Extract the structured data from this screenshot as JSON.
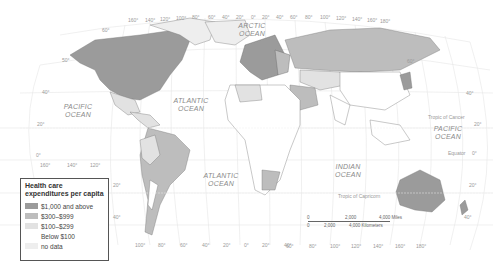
{
  "legend": {
    "title": "Health care expenditures per capita",
    "items": [
      {
        "label": "$1,000 and above",
        "color": "#9b9b9b"
      },
      {
        "label": "$300–$999",
        "color": "#bdbdbd"
      },
      {
        "label": "$100–$299",
        "color": "#e2e2e2"
      },
      {
        "label": "Below $100",
        "color": "#ffffff"
      },
      {
        "label": "no data",
        "color": "#eeeeee"
      }
    ]
  },
  "oceans": {
    "arctic": "ARCTIC OCEAN",
    "pacific_west": "PACIFIC OCEAN",
    "atlantic_north": "ATLANTIC OCEAN",
    "atlantic_south": "ATLANTIC OCEAN",
    "indian": "INDIAN OCEAN",
    "pacific_east": "PACIFIC OCEAN"
  },
  "lines": {
    "tropic_cancer": "Tropic of Cancer",
    "tropic_capricorn": "Tropic of Capricorn",
    "equator": "Equator"
  },
  "scale": {
    "miles": [
      "0",
      "2,000",
      "4,000 Miles"
    ],
    "km": [
      "0",
      "2,000",
      "4,000 Kilometers"
    ]
  },
  "top_longitudes": [
    "160°",
    "140°",
    "120°",
    "100°",
    "80°",
    "60°",
    "40°",
    "20°",
    "0°",
    "20°",
    "40°",
    "60°",
    "80°",
    "100°",
    "120°",
    "140°",
    "160°",
    "180°"
  ],
  "bottom_longitudes_left": [
    "100°",
    "80°",
    "60°",
    "40°",
    "20°",
    "0°",
    "20°",
    "40°"
  ],
  "bottom_longitudes_right": [
    "60°",
    "80°",
    "100°",
    "120°",
    "140°",
    "160°",
    "180°"
  ],
  "left_latitudes": [
    "60°",
    "50°",
    "40°",
    "20°",
    "0°"
  ],
  "left_longitudes": [
    "160°",
    "140°",
    "120°"
  ],
  "right_latitudes": [
    "60°",
    "40°",
    "20°",
    "0°",
    "20°",
    "40°"
  ],
  "legend_side_latitudes": [
    "20°",
    "40°"
  ]
}
